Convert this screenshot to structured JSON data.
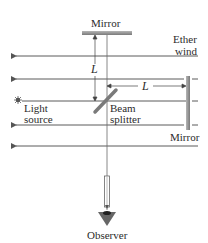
{
  "diagram": {
    "labels": {
      "top_mirror": "Mirror",
      "ether_wind_line1": "Ether",
      "ether_wind_line2": "wind",
      "arm_length_vertical": "L",
      "arm_length_horizontal": "L",
      "light_source_line1": "Light",
      "light_source_line2": "source",
      "beam_splitter_line1": "Beam",
      "beam_splitter_line2": "splitter",
      "side_mirror": "Mirror",
      "observer": "Observer"
    },
    "ether_wind": {
      "direction": "left",
      "line_y": [
        56,
        79,
        101,
        125,
        146
      ]
    },
    "colors": {
      "line": "#555555",
      "mirror": "#8a8a8a",
      "splitter": "#777777",
      "eye": "#444444",
      "text": "#2b2b2b"
    }
  }
}
